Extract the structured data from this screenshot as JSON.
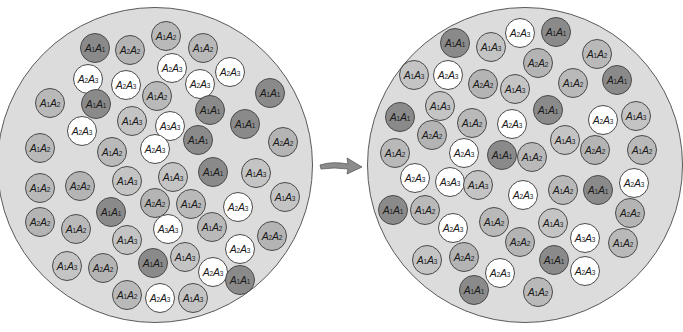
{
  "colors": {
    "A1A1": "#8a8a8a",
    "A1A2": "#b9b9b9",
    "A1A3": "#c4c4c4",
    "A2A2": "#b4b4b4",
    "A2A3": "#ffffff",
    "A3A3": "#ffffff",
    "population_bg": "#dcdcdc",
    "arrow": "#8c8c8c"
  },
  "arrow": {
    "icon": "right-arrow-icon"
  },
  "populations": [
    {
      "name": "before",
      "circle": {
        "cx": 155,
        "cy": 165,
        "r": 158
      },
      "individuals": [
        {
          "g": "A1A1",
          "x": 95,
          "y": 48
        },
        {
          "g": "A2A2",
          "x": 130,
          "y": 50
        },
        {
          "g": "A1A2",
          "x": 166,
          "y": 36
        },
        {
          "g": "A1A2",
          "x": 203,
          "y": 48
        },
        {
          "g": "A2A3",
          "x": 88,
          "y": 79
        },
        {
          "g": "A2A3",
          "x": 126,
          "y": 85
        },
        {
          "g": "A2A3",
          "x": 172,
          "y": 68
        },
        {
          "g": "A2A3",
          "x": 200,
          "y": 84
        },
        {
          "g": "A2A3",
          "x": 230,
          "y": 72
        },
        {
          "g": "A1A2",
          "x": 50,
          "y": 103
        },
        {
          "g": "A1A1",
          "x": 96,
          "y": 104
        },
        {
          "g": "A1A2",
          "x": 157,
          "y": 96
        },
        {
          "g": "A1A1",
          "x": 210,
          "y": 110
        },
        {
          "g": "A1A1",
          "x": 270,
          "y": 93
        },
        {
          "g": "A2A3",
          "x": 82,
          "y": 131
        },
        {
          "g": "A1A3",
          "x": 132,
          "y": 121
        },
        {
          "g": "A3A3",
          "x": 170,
          "y": 126
        },
        {
          "g": "A1A1",
          "x": 198,
          "y": 140
        },
        {
          "g": "A1A1",
          "x": 245,
          "y": 124
        },
        {
          "g": "A1A2",
          "x": 40,
          "y": 148
        },
        {
          "g": "A1A2",
          "x": 112,
          "y": 152
        },
        {
          "g": "A2A3",
          "x": 155,
          "y": 149
        },
        {
          "g": "A2A2",
          "x": 283,
          "y": 142
        },
        {
          "g": "A1A1",
          "x": 213,
          "y": 172
        },
        {
          "g": "A1A3",
          "x": 173,
          "y": 177
        },
        {
          "g": "A1A3",
          "x": 127,
          "y": 181
        },
        {
          "g": "A1A2",
          "x": 40,
          "y": 188
        },
        {
          "g": "A2A2",
          "x": 80,
          "y": 186
        },
        {
          "g": "A1A3",
          "x": 256,
          "y": 173
        },
        {
          "g": "A1A3",
          "x": 285,
          "y": 197
        },
        {
          "g": "A1A1",
          "x": 111,
          "y": 212
        },
        {
          "g": "A2A2",
          "x": 155,
          "y": 203
        },
        {
          "g": "A1A2",
          "x": 191,
          "y": 204
        },
        {
          "g": "A2A3",
          "x": 238,
          "y": 207
        },
        {
          "g": "A2A2",
          "x": 40,
          "y": 222
        },
        {
          "g": "A1A2",
          "x": 76,
          "y": 229
        },
        {
          "g": "A1A3",
          "x": 127,
          "y": 240
        },
        {
          "g": "A3A3",
          "x": 168,
          "y": 229
        },
        {
          "g": "A1A2",
          "x": 212,
          "y": 227
        },
        {
          "g": "A2A2",
          "x": 272,
          "y": 236
        },
        {
          "g": "A1A3",
          "x": 67,
          "y": 266
        },
        {
          "g": "A2A2",
          "x": 103,
          "y": 268
        },
        {
          "g": "A1A1",
          "x": 153,
          "y": 263
        },
        {
          "g": "A1A3",
          "x": 185,
          "y": 257
        },
        {
          "g": "A2A3",
          "x": 240,
          "y": 249
        },
        {
          "g": "A2A3",
          "x": 213,
          "y": 272
        },
        {
          "g": "A1A1",
          "x": 240,
          "y": 280
        },
        {
          "g": "A1A2",
          "x": 127,
          "y": 295
        },
        {
          "g": "A2A3",
          "x": 160,
          "y": 298
        },
        {
          "g": "A1A3",
          "x": 193,
          "y": 298
        }
      ]
    },
    {
      "name": "after",
      "circle": {
        "cx": 525,
        "cy": 165,
        "r": 158
      },
      "individuals": [
        {
          "g": "A1A1",
          "x": 455,
          "y": 43
        },
        {
          "g": "A1A3",
          "x": 491,
          "y": 47
        },
        {
          "g": "A2A3",
          "x": 520,
          "y": 33
        },
        {
          "g": "A1A1",
          "x": 556,
          "y": 32
        },
        {
          "g": "A2A2",
          "x": 538,
          "y": 63
        },
        {
          "g": "A1A2",
          "x": 597,
          "y": 54
        },
        {
          "g": "A1A3",
          "x": 414,
          "y": 75
        },
        {
          "g": "A2A3",
          "x": 448,
          "y": 75
        },
        {
          "g": "A2A2",
          "x": 483,
          "y": 84
        },
        {
          "g": "A1A3",
          "x": 515,
          "y": 89
        },
        {
          "g": "A1A2",
          "x": 573,
          "y": 83
        },
        {
          "g": "A1A1",
          "x": 617,
          "y": 80
        },
        {
          "g": "A1A3",
          "x": 440,
          "y": 106
        },
        {
          "g": "A1A1",
          "x": 400,
          "y": 117
        },
        {
          "g": "A1A1",
          "x": 548,
          "y": 110
        },
        {
          "g": "A1A2",
          "x": 472,
          "y": 123
        },
        {
          "g": "A2A3",
          "x": 512,
          "y": 124
        },
        {
          "g": "A2A3",
          "x": 603,
          "y": 120
        },
        {
          "g": "A1A3",
          "x": 636,
          "y": 116
        },
        {
          "g": "A2A2",
          "x": 432,
          "y": 135
        },
        {
          "g": "A1A3",
          "x": 565,
          "y": 140
        },
        {
          "g": "A1A2",
          "x": 395,
          "y": 153
        },
        {
          "g": "A2A3",
          "x": 464,
          "y": 153
        },
        {
          "g": "A1A1",
          "x": 502,
          "y": 155
        },
        {
          "g": "A1A2",
          "x": 532,
          "y": 157
        },
        {
          "g": "A2A2",
          "x": 595,
          "y": 150
        },
        {
          "g": "A1A2",
          "x": 642,
          "y": 150
        },
        {
          "g": "A2A3",
          "x": 415,
          "y": 178
        },
        {
          "g": "A3A3",
          "x": 450,
          "y": 182
        },
        {
          "g": "A1A3",
          "x": 478,
          "y": 185
        },
        {
          "g": "A2A3",
          "x": 523,
          "y": 195
        },
        {
          "g": "A1A2",
          "x": 563,
          "y": 190
        },
        {
          "g": "A1A1",
          "x": 598,
          "y": 190
        },
        {
          "g": "A2A3",
          "x": 634,
          "y": 183
        },
        {
          "g": "A1A1",
          "x": 393,
          "y": 210
        },
        {
          "g": "A1A2",
          "x": 425,
          "y": 210
        },
        {
          "g": "A2A2",
          "x": 630,
          "y": 213
        },
        {
          "g": "A2A3",
          "x": 453,
          "y": 228
        },
        {
          "g": "A1A2",
          "x": 494,
          "y": 222
        },
        {
          "g": "A1A3",
          "x": 553,
          "y": 223
        },
        {
          "g": "A2A2",
          "x": 520,
          "y": 242
        },
        {
          "g": "A3A3",
          "x": 585,
          "y": 238
        },
        {
          "g": "A1A2",
          "x": 623,
          "y": 243
        },
        {
          "g": "A1A3",
          "x": 427,
          "y": 260
        },
        {
          "g": "A2A2",
          "x": 464,
          "y": 257
        },
        {
          "g": "A1A1",
          "x": 554,
          "y": 260
        },
        {
          "g": "A2A3",
          "x": 500,
          "y": 273
        },
        {
          "g": "A2A3",
          "x": 585,
          "y": 271
        },
        {
          "g": "A1A1",
          "x": 474,
          "y": 290
        },
        {
          "g": "A1A2",
          "x": 538,
          "y": 292
        }
      ]
    }
  ]
}
